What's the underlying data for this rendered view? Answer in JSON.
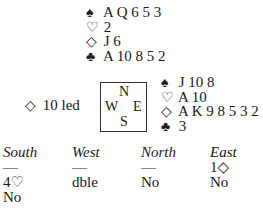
{
  "north": {
    "spades": {
      "symbol": "♠",
      "cards": "A Q 6 5 3"
    },
    "hearts": {
      "symbol": "♡",
      "cards": "2"
    },
    "diamonds": {
      "symbol": "◇",
      "cards": "J 6"
    },
    "clubs": {
      "symbol": "♣",
      "cards": "A 10 8 5 2"
    }
  },
  "east": {
    "spades": {
      "symbol": "♠",
      "cards": "J 10 8"
    },
    "hearts": {
      "symbol": "♡",
      "cards": "A 10"
    },
    "diamonds": {
      "symbol": "◇",
      "cards": "A K 9 8 5 3 2"
    },
    "clubs": {
      "symbol": "♣",
      "cards": "3"
    }
  },
  "opening_lead": {
    "symbol": "◇",
    "text": "10 led"
  },
  "compass": {
    "n": "N",
    "w": "W",
    "e": "E",
    "s": "S"
  },
  "auction": {
    "headers": [
      "South",
      "West",
      "North",
      "East"
    ],
    "rows": [
      [
        "—",
        "—",
        "—",
        "1◇"
      ],
      [
        "4♡",
        "dble",
        "No",
        "No"
      ],
      [
        "No",
        "",
        "",
        ""
      ]
    ]
  }
}
